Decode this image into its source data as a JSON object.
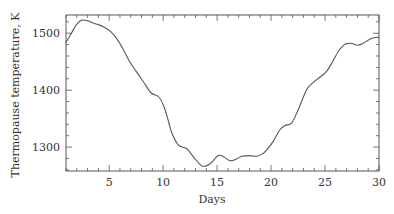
{
  "chart_data": {
    "type": "line",
    "title": "",
    "xlabel": "Days",
    "ylabel": "Thermopause temperature, K",
    "xlim": [
      1,
      30
    ],
    "ylim": [
      1258,
      1532
    ],
    "xticks": [
      5,
      10,
      15,
      20,
      25,
      30
    ],
    "xtick_labels": [
      "5",
      "10",
      "15",
      "20",
      "25",
      "30"
    ],
    "x_minor_step": 1,
    "yticks": [
      1300,
      1400,
      1500
    ],
    "ytick_labels": [
      "1300",
      "1400",
      "1500"
    ],
    "y_minor_step": 20,
    "grid": false,
    "legend": null,
    "series": [
      {
        "name": "Thermopause temperature",
        "color": "#555555",
        "x": [
          1.0,
          1.5,
          2.0,
          2.5,
          3.0,
          3.5,
          4.0,
          4.5,
          5.2,
          5.8,
          6.4,
          6.9,
          7.5,
          8.2,
          8.9,
          9.6,
          10.1,
          10.5,
          10.8,
          11.4,
          12.2,
          12.8,
          13.6,
          14.3,
          15.1,
          15.6,
          16.2,
          16.8,
          17.3,
          18.0,
          18.7,
          19.2,
          19.6,
          20.2,
          20.8,
          21.3,
          21.9,
          22.5,
          23.0,
          23.4,
          24.2,
          25.1,
          25.7,
          26.3,
          26.8,
          27.1,
          27.5,
          28.0,
          28.5,
          29.1,
          29.5,
          30.0
        ],
        "y": [
          1484,
          1500,
          1516,
          1523,
          1522,
          1518,
          1515,
          1511,
          1502,
          1488,
          1468,
          1450,
          1433,
          1414,
          1395,
          1388,
          1370,
          1345,
          1325,
          1304,
          1297,
          1283,
          1267,
          1270,
          1285,
          1283,
          1276,
          1279,
          1284,
          1285,
          1284,
          1288,
          1295,
          1310,
          1330,
          1338,
          1342,
          1365,
          1388,
          1404,
          1418,
          1432,
          1450,
          1470,
          1480,
          1482,
          1482,
          1479,
          1482,
          1489,
          1492,
          1493
        ]
      }
    ]
  },
  "axes": {
    "x_title": "Days",
    "y_title": "Thermopause temperature, K"
  }
}
